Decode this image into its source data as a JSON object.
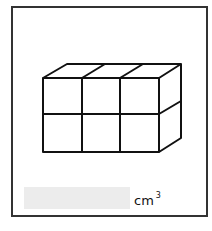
{
  "question": {
    "figure": {
      "type": "cuboid-of-unit-cubes",
      "columns": 3,
      "rows": 2,
      "depth": 1
    },
    "answer": {
      "value": "",
      "unit": "cm",
      "unit_exponent": "3"
    }
  },
  "colors": {
    "stroke": "#111111",
    "border": "#333333",
    "answer_box": "#ececec"
  }
}
